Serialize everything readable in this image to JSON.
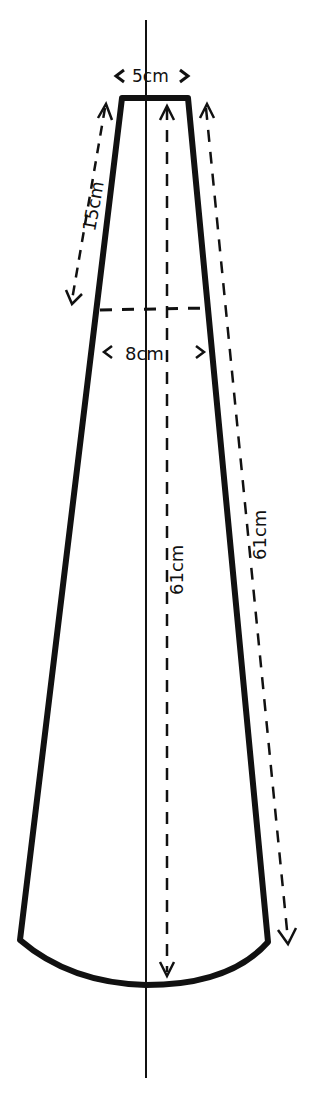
{
  "diagram": {
    "type": "sewing-pattern-piece",
    "labels": {
      "top_width": "5cm",
      "upper_length": "15cm",
      "mid_width": "8cm",
      "center_length": "61cm",
      "side_length": "61cm"
    },
    "colors": {
      "ink": "#111111",
      "background": "#ffffff"
    }
  }
}
